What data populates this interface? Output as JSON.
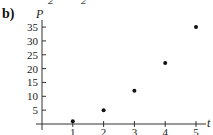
{
  "panel_label": "b)",
  "top_fragments": [
    "2",
    "2"
  ],
  "chart_data": {
    "type": "scatter",
    "title": "",
    "xlabel": "t",
    "ylabel": "P",
    "x": [
      1,
      2,
      3,
      4,
      5
    ],
    "values": [
      1,
      5,
      12,
      22,
      35
    ],
    "xlim": [
      0,
      5.5
    ],
    "ylim": [
      0,
      37
    ],
    "xticks": [
      1,
      2,
      3,
      4,
      5
    ],
    "yticks": [
      5,
      10,
      15,
      20,
      25,
      30,
      35
    ],
    "grid": false,
    "legend": null,
    "marker_color": "#111111"
  }
}
